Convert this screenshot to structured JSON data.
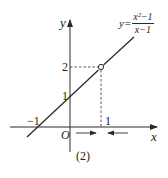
{
  "figure": {
    "caption": "(2)",
    "function_label": {
      "lhs": "y=",
      "numerator": "x²−1",
      "denominator": "x−1"
    },
    "axes": {
      "x_label": "x",
      "y_label": "y",
      "origin_label": "O"
    },
    "ticks": {
      "x_neg1": "−1",
      "x_1": "1",
      "y_1": "1",
      "y_2": "2"
    },
    "hole_point": {
      "x": 1,
      "y": 2
    }
  },
  "colors": {
    "ink": "#2a2a2a"
  }
}
